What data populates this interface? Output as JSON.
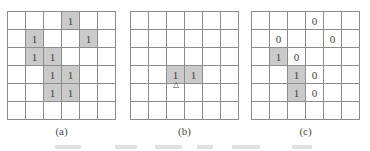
{
  "colors": {
    "bg": "#ffffff",
    "line": "#8c8c8c",
    "shade": "#cacaca",
    "numeral": "#3f3f3f",
    "label": "#4a4a4a"
  },
  "figure": {
    "marker_glyph": "△",
    "panels": [
      {
        "label": "(a)",
        "rows": 6,
        "cols": 6,
        "cells": [
          {
            "r": 1,
            "c": 4,
            "v": "1",
            "shaded": true
          },
          {
            "r": 2,
            "c": 2,
            "v": "1",
            "shaded": true
          },
          {
            "r": 2,
            "c": 5,
            "v": "1",
            "shaded": true
          },
          {
            "r": 3,
            "c": 2,
            "v": "1",
            "shaded": true
          },
          {
            "r": 3,
            "c": 3,
            "v": "1",
            "shaded": true
          },
          {
            "r": 4,
            "c": 3,
            "v": "1",
            "shaded": true
          },
          {
            "r": 4,
            "c": 4,
            "v": "1",
            "shaded": true
          },
          {
            "r": 5,
            "c": 3,
            "v": "1",
            "shaded": true
          },
          {
            "r": 5,
            "c": 4,
            "v": "1",
            "shaded": true
          }
        ]
      },
      {
        "label": "(b)",
        "rows": 6,
        "cols": 6,
        "cells": [
          {
            "r": 4,
            "c": 3,
            "v": "1",
            "shaded": true,
            "marker": true
          },
          {
            "r": 4,
            "c": 4,
            "v": "1",
            "shaded": true
          }
        ]
      },
      {
        "label": "(c)",
        "rows": 6,
        "cols": 6,
        "cells": [
          {
            "r": 1,
            "c": 4,
            "v": "0",
            "shaded": false
          },
          {
            "r": 2,
            "c": 2,
            "v": "0",
            "shaded": false
          },
          {
            "r": 2,
            "c": 5,
            "v": "0",
            "shaded": false
          },
          {
            "r": 3,
            "c": 2,
            "v": "1",
            "shaded": true
          },
          {
            "r": 3,
            "c": 3,
            "v": "0",
            "shaded": false
          },
          {
            "r": 4,
            "c": 3,
            "v": "1",
            "shaded": true
          },
          {
            "r": 4,
            "c": 4,
            "v": "0",
            "shaded": false
          },
          {
            "r": 5,
            "c": 3,
            "v": "1",
            "shaded": true
          },
          {
            "r": 5,
            "c": 4,
            "v": "0",
            "shaded": false
          }
        ]
      }
    ]
  }
}
